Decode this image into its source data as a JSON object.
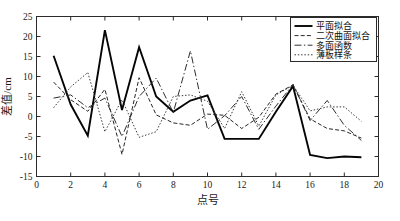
{
  "chart_data": {
    "type": "line",
    "title": "",
    "xlabel": "点号",
    "ylabel": "差值/cm",
    "xlim": [
      0,
      20
    ],
    "ylim": [
      -15,
      25
    ],
    "xticks": [
      0,
      2,
      4,
      6,
      8,
      10,
      12,
      14,
      16,
      18,
      20
    ],
    "yticks": [
      -15,
      -10,
      -5,
      0,
      5,
      10,
      15,
      20,
      25
    ],
    "grid": false,
    "legend_position": "top-right",
    "x": [
      1,
      2,
      3,
      4,
      5,
      6,
      7,
      8,
      9,
      10,
      11,
      12,
      13,
      14,
      15,
      16,
      17,
      18,
      19
    ],
    "series": [
      {
        "name": "平面拟合",
        "style": "solid",
        "values": [
          15.2,
          3.0,
          -4.8,
          21.6,
          1.6,
          17.3,
          5.0,
          1.2,
          4.0,
          5.3,
          -5.6,
          -5.6,
          -5.6,
          1.2,
          7.6,
          -9.6,
          -10.4,
          -10.0,
          -10.2
        ]
      },
      {
        "name": "二次曲面拟合",
        "style": "dashed",
        "values": [
          8.6,
          4.2,
          1.3,
          6.8,
          -9.5,
          9.7,
          0.4,
          -1.6,
          -2.2,
          0.6,
          0.3,
          -3.0,
          -0.2,
          5.6,
          7.9,
          -0.6,
          -3.0,
          -3.6,
          -5.4
        ]
      },
      {
        "name": "多面函数",
        "style": "dashdot",
        "values": [
          4.6,
          5.4,
          2.2,
          4.6,
          -5.0,
          5.0,
          9.6,
          1.0,
          16.4,
          -3.2,
          0.2,
          5.0,
          -3.2,
          2.6,
          8.0,
          -1.0,
          4.0,
          -2.2,
          -6.0
        ]
      },
      {
        "name": "薄板样条",
        "style": "dotted",
        "values": [
          2.2,
          7.4,
          11.0,
          -3.8,
          4.2,
          -5.2,
          -3.8,
          5.0,
          5.4,
          3.8,
          -3.0,
          6.2,
          -2.4,
          5.4,
          7.8,
          1.4,
          2.4,
          2.4,
          -1.2
        ]
      }
    ]
  },
  "legend": {
    "items": [
      {
        "label": "平面拟合"
      },
      {
        "label": "二次曲面拟合"
      },
      {
        "label": "多面函数"
      },
      {
        "label": "薄板样条"
      }
    ]
  }
}
